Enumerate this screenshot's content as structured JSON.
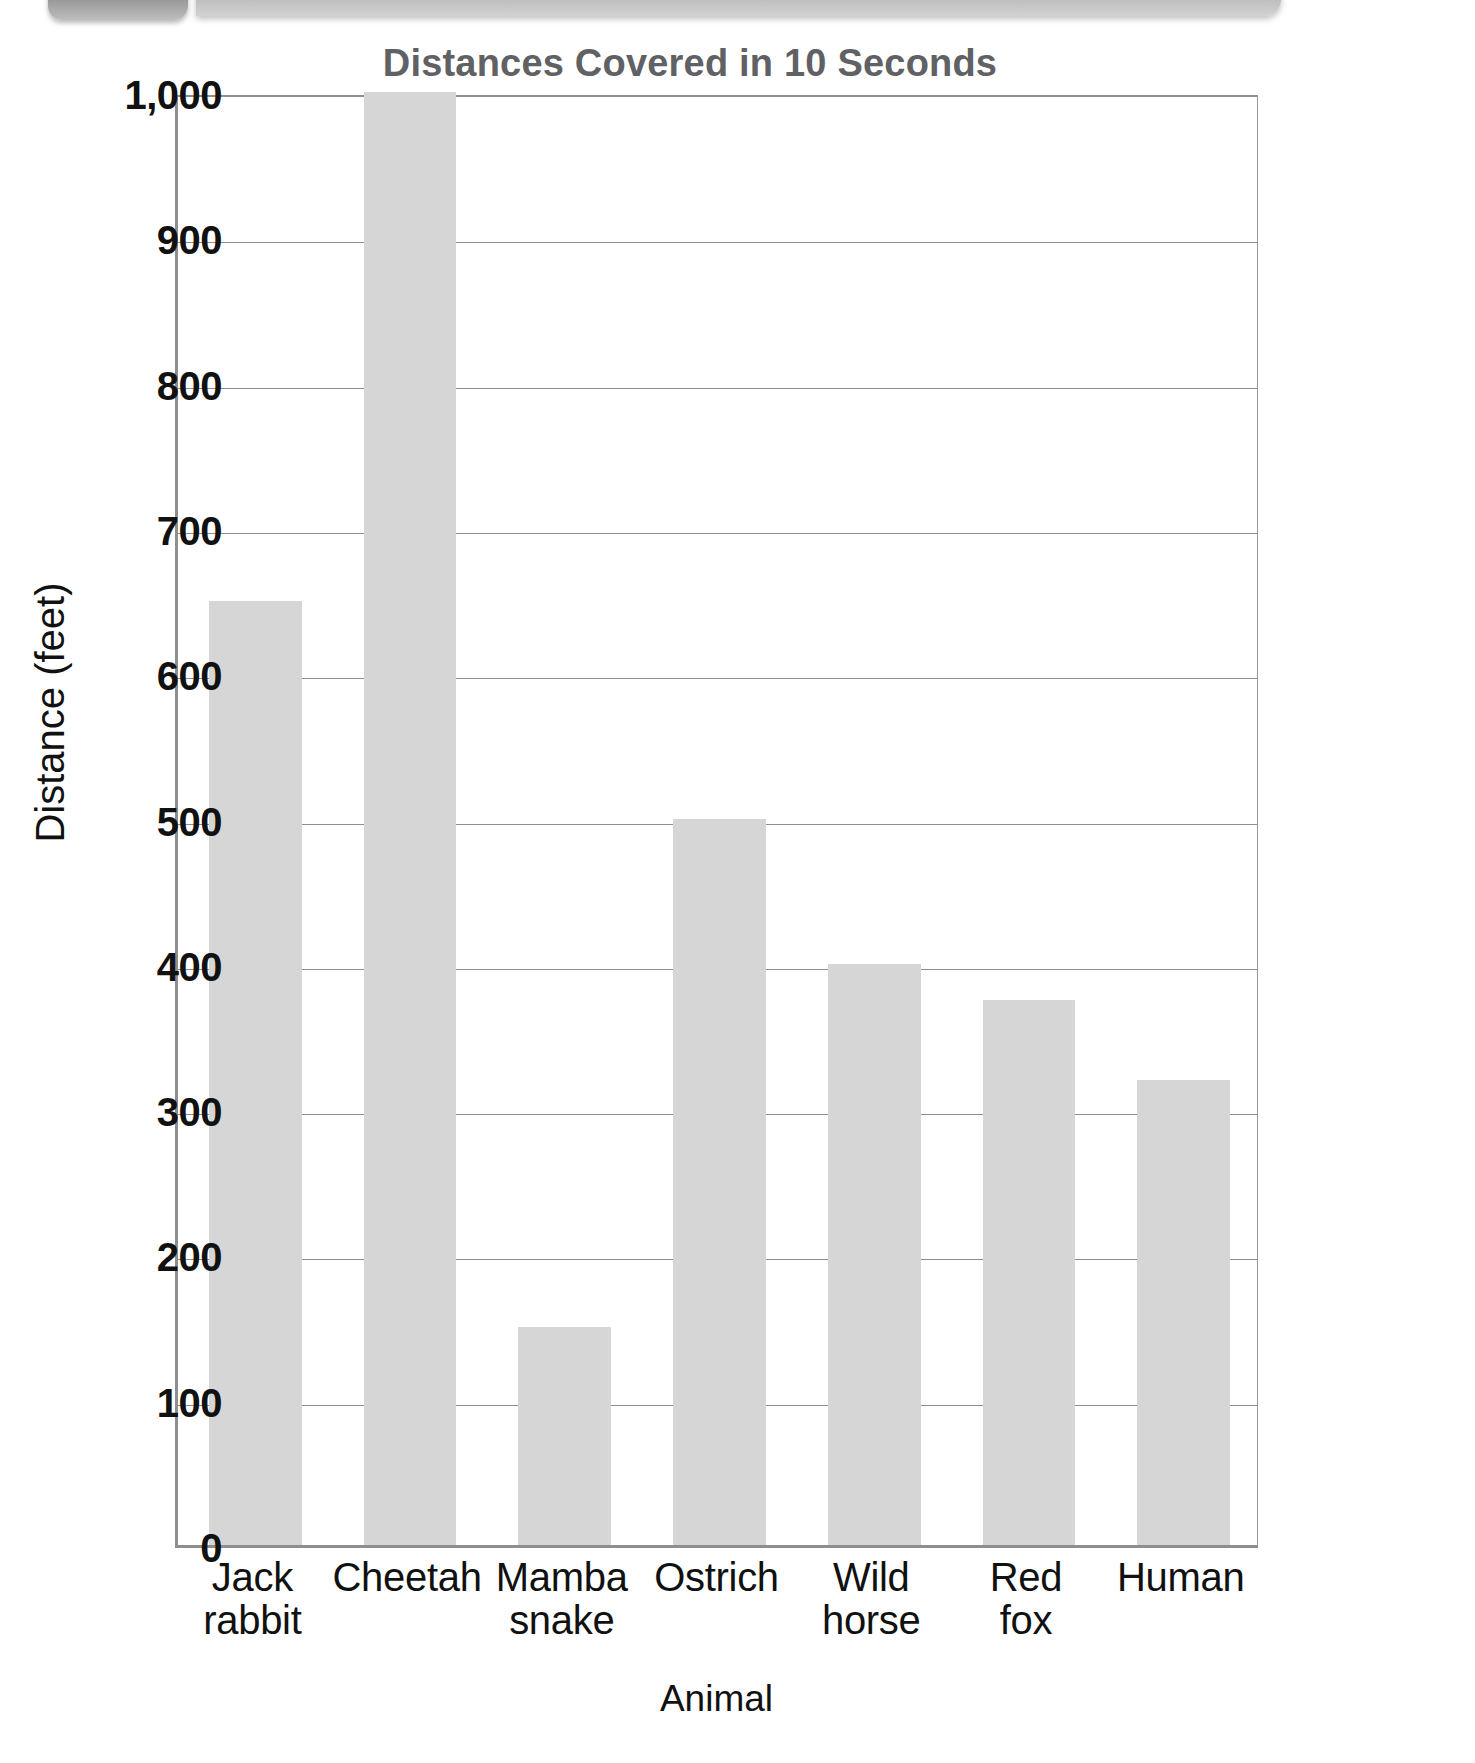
{
  "decoration": {
    "left_tab_name": "page-tab-decoration",
    "right_bar_name": "page-banner-decoration"
  },
  "chart_data": {
    "type": "bar",
    "title": "Distances Covered in 10 Seconds",
    "xlabel": "Animal",
    "ylabel": "Distance (feet)",
    "ylim": [
      0,
      1000
    ],
    "ytick_values": [
      0,
      100,
      200,
      300,
      400,
      500,
      600,
      700,
      800,
      900,
      1000
    ],
    "ytick_labels": [
      "0",
      "100",
      "200",
      "300",
      "400",
      "500",
      "600",
      "700",
      "800",
      "900",
      "1,000"
    ],
    "grid": true,
    "legend": "none",
    "bar_color": "#d6d6d6",
    "categories": [
      "Jack rabbit",
      "Cheetah",
      "Mamba snake",
      "Ostrich",
      "Wild horse",
      "Red fox",
      "Human"
    ],
    "category_lines": [
      [
        "Jack",
        "rabbit"
      ],
      [
        "Cheetah",
        ""
      ],
      [
        "Mamba",
        "snake"
      ],
      [
        "Ostrich",
        ""
      ],
      [
        "Wild",
        "horse"
      ],
      [
        "Red",
        "fox"
      ],
      [
        "Human",
        ""
      ]
    ],
    "values": [
      650,
      1000,
      150,
      500,
      400,
      375,
      320
    ]
  }
}
